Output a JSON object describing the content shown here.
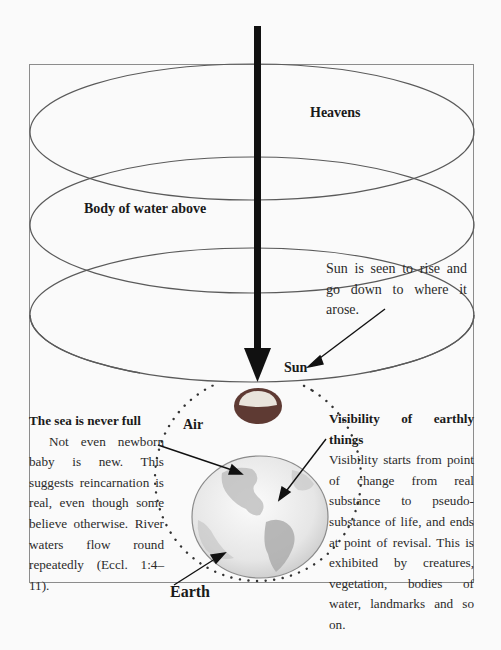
{
  "diagram": {
    "labels": {
      "heavens": "Heavens",
      "body_of_water": "Body of water above",
      "sun": "Sun",
      "air": "Air",
      "earth": "Earth"
    },
    "sun_note": "Sun is seen to rise and go down to where it arose.",
    "left_block": {
      "heading": "The sea is never full",
      "body": "Not even newborn baby is new. This suggests reincarnation is real, even though some believe otherwise. River waters flow round repeatedly (Eccl. 1:4–11)."
    },
    "right_block": {
      "heading": "Visibility of earthly things",
      "body": "Visibility starts from point of change from real substance to pseudo-substance of life, and ends at point of revisal. This is exhibited by creatures, vegetation, bodies of water, landmarks and so on."
    },
    "colors": {
      "frame": "#8c8c8c",
      "ellipse_stroke": "#5a5a5a",
      "arrow": "#111111",
      "sun_outer": "#5e3a33",
      "sun_inner": "#e9e4dc",
      "dots": "#333333",
      "earth_fill": "#ececec"
    }
  }
}
